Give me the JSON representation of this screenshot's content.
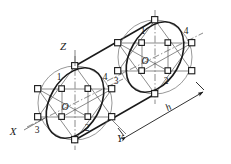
{
  "figure": {
    "title": "",
    "type": "isometric-cylinder-four-center-ellipse-construction",
    "axes": {
      "x_label": "X",
      "y_label": "Y",
      "z_label": "Z"
    },
    "dimension": {
      "label": "h"
    },
    "left_face": {
      "center_label": "O",
      "point_labels": [
        "1",
        "2",
        "3",
        "4"
      ]
    },
    "right_face": {
      "center_label": "O",
      "point_labels": [
        "1",
        "2",
        "3",
        "4"
      ]
    },
    "colors": {
      "ink": "#1a1a1a",
      "thin": "#555555",
      "background": "#ffffff"
    }
  }
}
